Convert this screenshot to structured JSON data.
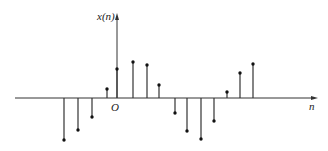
{
  "figure": {
    "y_axis_label": "x(n)",
    "x_axis_label": "n",
    "origin_label": "O",
    "stroke_color": "#333333",
    "background": "#ffffff"
  },
  "chart_data": {
    "type": "stem",
    "title": "",
    "xlabel": "n",
    "ylabel": "x(n)",
    "origin_label": "O",
    "grid": false,
    "legend": null,
    "x": [
      -4,
      -3,
      -2,
      -1,
      0,
      1,
      2,
      3,
      4,
      5,
      6,
      7,
      8,
      9,
      10
    ],
    "values": [
      -42,
      -32,
      -19,
      9,
      29,
      36,
      33,
      13,
      -15,
      -33,
      -41,
      -23,
      6,
      25,
      34
    ],
    "value_units": "relative amplitude (px above axis, no tick labels shown)",
    "xlim": [
      -8,
      15
    ],
    "ylim": [
      -50,
      85
    ]
  },
  "layout": {
    "axis_y_px": 98,
    "origin_x_px": 117,
    "x_axis_start_px": 15,
    "x_axis_end_px": 318,
    "y_axis_top_px": 13,
    "stem_x_px": [
      64,
      78,
      92,
      107,
      117,
      133,
      147,
      159,
      175,
      187,
      201,
      214,
      227,
      240,
      253
    ]
  }
}
